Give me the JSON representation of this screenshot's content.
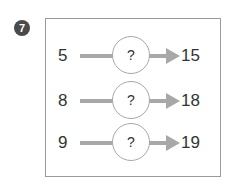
{
  "problem_number": "7",
  "rows": [
    {
      "input": "5",
      "operator": "?",
      "output": "15"
    },
    {
      "input": "8",
      "operator": "?",
      "output": "18"
    },
    {
      "input": "9",
      "operator": "?",
      "output": "19"
    }
  ]
}
